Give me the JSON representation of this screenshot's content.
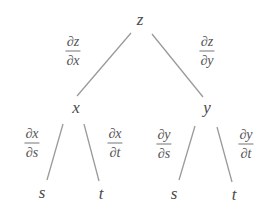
{
  "diagram": {
    "type": "tree-diagram",
    "line_color": "#9a9a9a",
    "nodes": [
      {
        "id": "z",
        "label": "z",
        "x": 140,
        "y": 19
      },
      {
        "id": "x",
        "label": "x",
        "x": 76,
        "y": 107
      },
      {
        "id": "y",
        "label": "y",
        "x": 207,
        "y": 107
      },
      {
        "id": "xs",
        "label": "s",
        "x": 42,
        "y": 192
      },
      {
        "id": "xt",
        "label": "t",
        "x": 101,
        "y": 193
      },
      {
        "id": "ys",
        "label": "s",
        "x": 174,
        "y": 193
      },
      {
        "id": "yt",
        "label": "t",
        "x": 234,
        "y": 194
      }
    ],
    "edges": [
      {
        "from": "z",
        "to": "x",
        "x1": 131,
        "y1": 33,
        "x2": 77,
        "y2": 96,
        "label": {
          "num": "∂z",
          "den": "∂x",
          "x": 73,
          "y": 51
        }
      },
      {
        "from": "z",
        "to": "y",
        "x1": 152,
        "y1": 34,
        "x2": 203,
        "y2": 97,
        "label": {
          "num": "∂z",
          "den": "∂y",
          "x": 207,
          "y": 51
        }
      },
      {
        "from": "x",
        "to": "s",
        "x1": 63,
        "y1": 124,
        "x2": 47,
        "y2": 180,
        "label": {
          "num": "∂x",
          "den": "∂s",
          "x": 32,
          "y": 143
        }
      },
      {
        "from": "x",
        "to": "t",
        "x1": 84,
        "y1": 124,
        "x2": 99,
        "y2": 181,
        "label": {
          "num": "∂x",
          "den": "∂t",
          "x": 115,
          "y": 143
        }
      },
      {
        "from": "y",
        "to": "s",
        "x1": 195,
        "y1": 126,
        "x2": 179,
        "y2": 180,
        "label": {
          "num": "∂y",
          "den": "∂s",
          "x": 164,
          "y": 144
        }
      },
      {
        "from": "y",
        "to": "t",
        "x1": 217,
        "y1": 127,
        "x2": 232,
        "y2": 182,
        "label": {
          "num": "∂y",
          "den": "∂t",
          "x": 246,
          "y": 144
        }
      }
    ]
  }
}
